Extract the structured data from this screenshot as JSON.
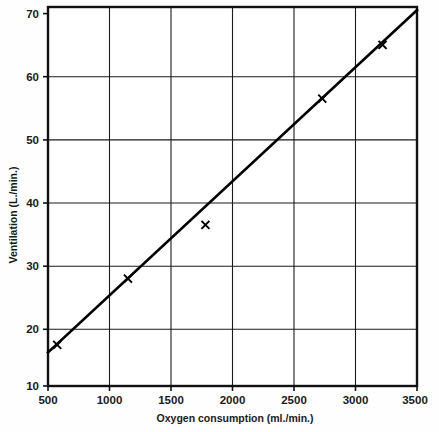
{
  "chart_data": {
    "type": "scatter",
    "title": "",
    "xlabel": "Oxygen consumption (ml./min.)",
    "ylabel": "Ventilation (L./min.)",
    "xlim": [
      500,
      3500
    ],
    "ylim": [
      10,
      70
    ],
    "xticks": [
      500,
      1000,
      1500,
      2000,
      2500,
      3000,
      3500
    ],
    "yticks": [
      10,
      20,
      30,
      40,
      50,
      60,
      70
    ],
    "xtick_labels": [
      "500",
      "1000",
      "1500",
      "2000",
      "2500",
      "3000",
      "3500"
    ],
    "ytick_labels": [
      "10",
      "20",
      "30",
      "40",
      "50",
      "60",
      "70"
    ],
    "grid": true,
    "grid_color": "#1a1a1a",
    "legend": "none",
    "series": [
      {
        "name": "Data points",
        "marker": "x",
        "color": "#000000",
        "x": [
          575,
          1150,
          1780,
          2730,
          3220
        ],
        "y": [
          16.5,
          27.0,
          35.5,
          55.5,
          64.0
        ]
      },
      {
        "name": "Regression line",
        "marker": "none",
        "color": "#000000",
        "x": [
          500,
          3500
        ],
        "y": [
          15.3,
          69.5
        ]
      }
    ]
  },
  "axes": {
    "x_axis_label": "Oxygen consumption (ml./min.)",
    "y_axis_label": "Ventilation (L./min.)"
  }
}
